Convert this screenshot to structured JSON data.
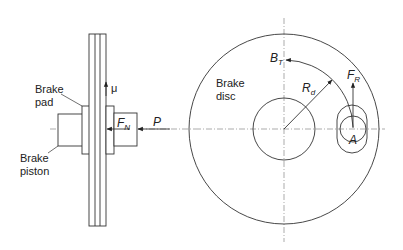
{
  "diagram": {
    "colors": {
      "line": "#333333",
      "centerline": "#888888",
      "background": "#ffffff"
    },
    "side_view": {
      "labels": {
        "brake_pad": [
          "Brake",
          "pad"
        ],
        "brake_piston": [
          "Brake",
          "piston"
        ],
        "friction_coefficient": "μ",
        "normal_force": {
          "main": "F",
          "sub": "N"
        },
        "pressure": "P"
      }
    },
    "front_view": {
      "labels": {
        "brake_disc": [
          "Brake",
          "disc"
        ],
        "braking_torque": {
          "main": "B",
          "sub": "T"
        },
        "disc_radius": {
          "main": "R",
          "sub": "d"
        },
        "reaction_force": {
          "main": "F",
          "sub": "R"
        },
        "point": "A"
      }
    }
  }
}
